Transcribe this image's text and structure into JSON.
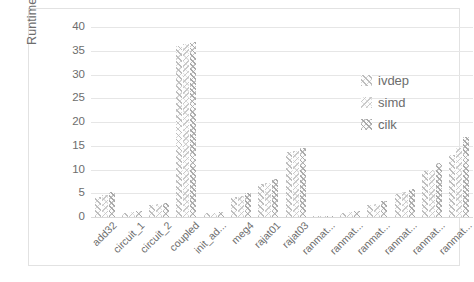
{
  "chart_data": {
    "type": "bar",
    "title": "",
    "xlabel": "",
    "ylabel": "Runtime (seconds)",
    "ylim": [
      0,
      40
    ],
    "ytick_step": 5,
    "yticks": [
      "40",
      "35",
      "30",
      "25",
      "20",
      "15",
      "10",
      "5",
      "0"
    ],
    "grid": true,
    "legend_position": "inside-top-right",
    "categories": [
      "add32",
      "circuit_1",
      "circuit_2",
      "coupled",
      "init_ad...",
      "meg4",
      "rajat01",
      "rajat03",
      "ranmat...",
      "ranmat...",
      "ranmat...",
      "ranmat...",
      "ranmat...",
      "ranmat..."
    ],
    "series": [
      {
        "name": "ivdep",
        "values": [
          4.3,
          0.9,
          2.6,
          36.1,
          0.8,
          4.2,
          6.9,
          13.6,
          0.15,
          0.9,
          2.6,
          4.9,
          9.6,
          13.0
        ]
      },
      {
        "name": "simd",
        "values": [
          4.6,
          1.0,
          2.7,
          36.4,
          0.9,
          4.4,
          7.2,
          13.9,
          0.18,
          1.0,
          2.8,
          5.2,
          10.0,
          14.6
        ]
      },
      {
        "name": "cilk",
        "values": [
          5.2,
          1.2,
          3.0,
          36.8,
          1.0,
          5.0,
          7.9,
          14.6,
          0.22,
          1.2,
          3.3,
          5.9,
          11.4,
          16.8
        ]
      }
    ]
  },
  "legend": {
    "items": [
      {
        "label": "ivdep"
      },
      {
        "label": "simd"
      },
      {
        "label": "cilk"
      }
    ]
  },
  "colors": {
    "grid": "#e6e6e6",
    "axis": "#d8d8d8",
    "text": "#6d6d6d",
    "frame": "#e2e2e2",
    "background": "#ffffff"
  }
}
